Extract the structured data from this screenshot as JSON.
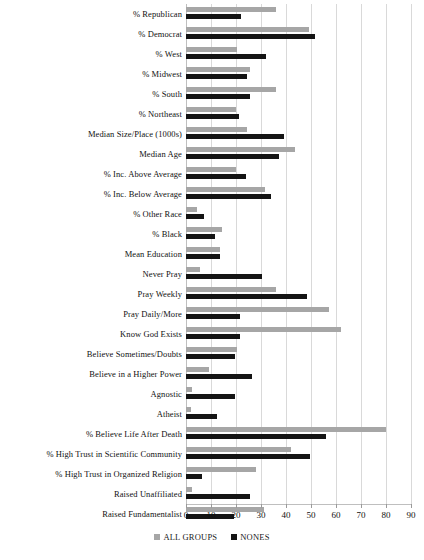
{
  "chart": {
    "type": "bar",
    "title": "",
    "xlabel": "",
    "ylabel": ""
  },
  "legend": {
    "position": "bottom-center",
    "entries": [
      {
        "name": "ALL GROUPS",
        "color": "#a6a6a6"
      },
      {
        "name": "NONES",
        "color": "#141414"
      }
    ]
  },
  "axis": {
    "ticks": [
      "0",
      "10",
      "20",
      "30",
      "40",
      "50",
      "60",
      "70",
      "80",
      "90"
    ],
    "min": 0,
    "max": 90
  },
  "chart_data": {
    "type": "bar",
    "orientation": "horizontal",
    "title": "",
    "xlabel": "",
    "ylabel": "",
    "xlim": [
      0,
      90
    ],
    "grid": true,
    "legend_position": "bottom-center",
    "tick_labels": [
      "0",
      "10",
      "20",
      "30",
      "40",
      "50",
      "60",
      "70",
      "80",
      "90"
    ],
    "categories": [
      "% Republican",
      "% Democrat",
      "% West",
      "% Midwest",
      "% South",
      "% Northeast",
      "Median Size/Place (1000s)",
      "Median Age",
      "% Inc. Above Average",
      "% Inc. Below Average",
      "% Other Race",
      "% Black",
      "Mean Education",
      "Never Pray",
      "Pray Weekly",
      "Pray Daily/More",
      "Know God Exists",
      "Believe Sometimes/Doubts",
      "Believe in a Higher Power",
      "Agnostic",
      "Atheist",
      "% Believe Life After Death",
      "% High Trust in Scientific Community",
      "% High Trust in Organized Religion",
      "Raised Unaffiliated",
      "Raised Fundamentalist"
    ],
    "series": [
      {
        "name": "ALL GROUPS",
        "color": "#a6a6a6",
        "values": [
          36,
          49,
          20.5,
          25.5,
          36,
          20,
          24.5,
          43.5,
          20,
          31.5,
          4.5,
          14.5,
          13.5,
          5.5,
          36,
          57,
          62,
          20.5,
          9,
          2.5,
          2,
          80,
          42,
          28,
          2.5,
          31
        ]
      },
      {
        "name": "NONES",
        "color": "#141414",
        "values": [
          22,
          51.5,
          32,
          24.5,
          25.5,
          21,
          39,
          37,
          24,
          34,
          7,
          11.5,
          13.5,
          30.5,
          48.5,
          21.5,
          21.5,
          19.5,
          26.5,
          19.5,
          12.5,
          56,
          49.5,
          6.5,
          25.5,
          19
        ]
      }
    ]
  }
}
